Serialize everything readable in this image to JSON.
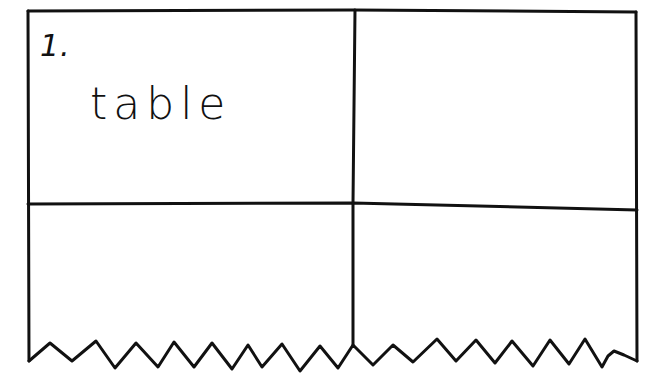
{
  "diagram": {
    "type": "torn table sketch",
    "grid": {
      "rows": 2,
      "columns": 2,
      "bottom_edge": "zigzag-torn"
    },
    "cells": [
      {
        "row": 0,
        "col": 0,
        "number": "1.",
        "text": "table"
      },
      {
        "row": 0,
        "col": 1,
        "number": "",
        "text": ""
      },
      {
        "row": 1,
        "col": 0,
        "number": "",
        "text": ""
      },
      {
        "row": 1,
        "col": 1,
        "number": "",
        "text": ""
      }
    ],
    "stroke_color": "#111111",
    "background_color": "#ffffff"
  }
}
